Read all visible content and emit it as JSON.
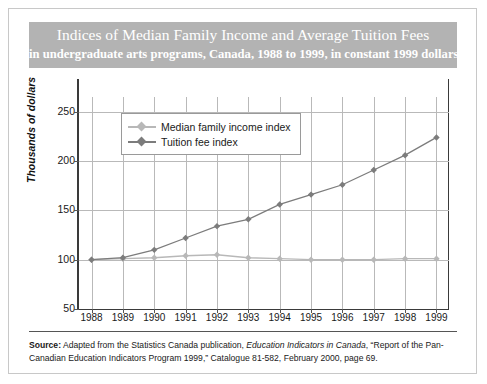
{
  "title": {
    "main": "Indices of Median Family Income and Average Tuition Fees",
    "sub": "in undergraduate arts programs, Canada, 1988 to 1999, in constant 1999 dollars"
  },
  "source": {
    "label": "Source:",
    "text_before_italic": " Adapted from the Statistics Canada publication, ",
    "italic": "Education Indicators in Canada",
    "text_after_italic": ", “Report of the Pan-Canadian Education Indicators Program 1999,” Catalogue 81-582, February 2000, page 69."
  },
  "colors": {
    "banner": "#b3b3b3",
    "income": "#b8b8b8",
    "tuition": "#7c7c7c",
    "gridline": "#b9b9b9",
    "axis": "#3a3a3a"
  },
  "chart_data": {
    "type": "line",
    "title": "Indices of Median Family Income and Average Tuition Fees",
    "subtitle": "in undergraduate arts programs, Canada, 1988 to 1999, in constant 1999 dollars",
    "xlabel": "",
    "ylabel": "Thousands of dollars",
    "x": [
      1988,
      1989,
      1990,
      1991,
      1992,
      1993,
      1994,
      1995,
      1996,
      1997,
      1998,
      1999
    ],
    "xticklabels": [
      "1988",
      "1989",
      "1990",
      "1991",
      "1992",
      "1993",
      "1994",
      "1995",
      "1996",
      "1997",
      "1998",
      "1999"
    ],
    "yticks": [
      50,
      100,
      150,
      200,
      250
    ],
    "yticklabels": [
      "50",
      "100",
      "150",
      "200",
      "250"
    ],
    "ylim": [
      50,
      265
    ],
    "xlim": [
      1987.6,
      1999.4
    ],
    "grid": true,
    "legend_position": "upper left",
    "series": [
      {
        "name": "Median family income index",
        "color": "#b8b8b8",
        "marker": "diamond",
        "values": [
          100,
          101,
          102,
          104,
          105,
          102,
          101,
          100,
          100,
          100,
          101,
          101
        ]
      },
      {
        "name": "Tuition fee index",
        "color": "#7c7c7c",
        "marker": "diamond",
        "values": [
          100,
          102,
          110,
          122,
          134,
          141,
          156,
          166,
          176,
          191,
          206,
          224
        ]
      }
    ]
  }
}
